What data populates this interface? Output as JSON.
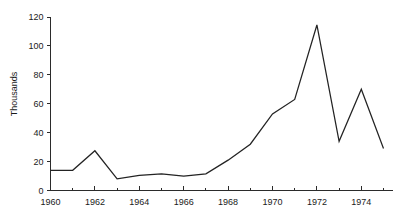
{
  "chart_data": {
    "type": "line",
    "title": "",
    "subtitle": "",
    "xlabel": "",
    "ylabel": "Thousands",
    "x": [
      1960,
      1961,
      1962,
      1963,
      1964,
      1965,
      1966,
      1967,
      1968,
      1969,
      1970,
      1971,
      1972,
      1973,
      1974,
      1975
    ],
    "values": [
      14,
      14,
      27.5,
      8,
      10.5,
      11.5,
      10,
      11.5,
      21,
      32,
      53,
      63,
      114.5,
      34,
      70,
      29
    ],
    "series": [
      {
        "name": "",
        "values": [
          14,
          14,
          27.5,
          8,
          10.5,
          11.5,
          10,
          11.5,
          21,
          32,
          53,
          63,
          114.5,
          34,
          70,
          29
        ]
      }
    ],
    "xlim": [
      1960,
      1975
    ],
    "ylim": [
      0,
      120
    ],
    "ytick_labels": [
      "0",
      "20",
      "40",
      "60",
      "80",
      "100",
      "120"
    ],
    "ytick_values": [
      0,
      20,
      40,
      60,
      80,
      100,
      120
    ],
    "xtick_labels": [
      "1960",
      "1962",
      "1964",
      "1966",
      "1968",
      "1970",
      "1972",
      "1974"
    ],
    "xtick_values": [
      1960,
      1962,
      1964,
      1966,
      1968,
      1970,
      1972,
      1974
    ],
    "xminor_tick_values": [
      1961,
      1963,
      1965,
      1967,
      1969,
      1971,
      1973,
      1975
    ],
    "grid": false,
    "legend": false,
    "legend_position": "none",
    "line_color": "#232323",
    "axis_color": "#2b2b2b",
    "background_color": "#ffffff",
    "annotations": []
  }
}
